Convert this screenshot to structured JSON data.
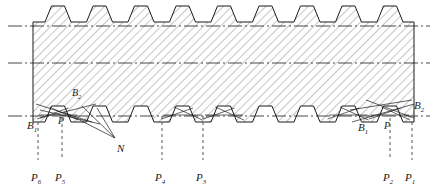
{
  "figure": {
    "type": "engineering-cross-section",
    "colors": {
      "outline": "#1a1a1a",
      "hatch": "#707070",
      "centerline": "#1a1a1a",
      "dashed_leader": "#555555",
      "background": "#ffffff"
    }
  },
  "geometry": {
    "body": {
      "left": 33,
      "right": 414,
      "top": 22,
      "bottom": 122
    },
    "top_teeth": {
      "count": 9,
      "pitch": 41.5,
      "first_center": 58,
      "height": 16,
      "top_width": 13,
      "base_width": 26
    },
    "bottom_teeth": {
      "count": 9,
      "pitch": 41.5,
      "first_center": 58,
      "depth": 16
    },
    "centerlines": [
      {
        "name": "upper-centerline",
        "y": 26
      },
      {
        "name": "lower-centerline",
        "y": 63
      },
      {
        "name": "pitch-centerline",
        "y": 116
      }
    ]
  },
  "labels": {
    "b1_left": {
      "text": "B",
      "sub": "1",
      "x": 27,
      "y": 120
    },
    "b2_left": {
      "text": "B",
      "sub": "2",
      "x": 72,
      "y": 88
    },
    "p_left": {
      "text": "P",
      "sub": "",
      "x": 58,
      "y": 116
    },
    "n": {
      "text": "N",
      "sub": "",
      "x": 117,
      "y": 143
    },
    "b1_right": {
      "text": "B",
      "sub": "1",
      "x": 358,
      "y": 122
    },
    "p_right": {
      "text": "P",
      "sub": "",
      "x": 384,
      "y": 121
    },
    "b2_right": {
      "text": "B",
      "sub": "2",
      "x": 414,
      "y": 100
    }
  },
  "pitch_markers": [
    {
      "name": "P6",
      "text": "P",
      "sub": "6",
      "x": 38,
      "label_x": 31,
      "label_y": 172,
      "top": 122,
      "bottom": 160
    },
    {
      "name": "P5",
      "text": "P",
      "sub": "5",
      "x": 62,
      "label_x": 55,
      "label_y": 172,
      "top": 118,
      "bottom": 160
    },
    {
      "name": "P4",
      "text": "P",
      "sub": "4",
      "x": 162,
      "label_x": 155,
      "label_y": 172,
      "top": 116,
      "bottom": 160
    },
    {
      "name": "P3",
      "text": "P",
      "sub": "3",
      "x": 203,
      "label_x": 196,
      "label_y": 172,
      "top": 116,
      "bottom": 160
    },
    {
      "name": "P2",
      "text": "P",
      "sub": "2",
      "x": 390,
      "label_x": 383,
      "label_y": 172,
      "top": 118,
      "bottom": 160
    },
    {
      "name": "P1",
      "text": "P",
      "sub": "1",
      "x": 412,
      "label_x": 405,
      "label_y": 172,
      "top": 122,
      "bottom": 160
    }
  ]
}
